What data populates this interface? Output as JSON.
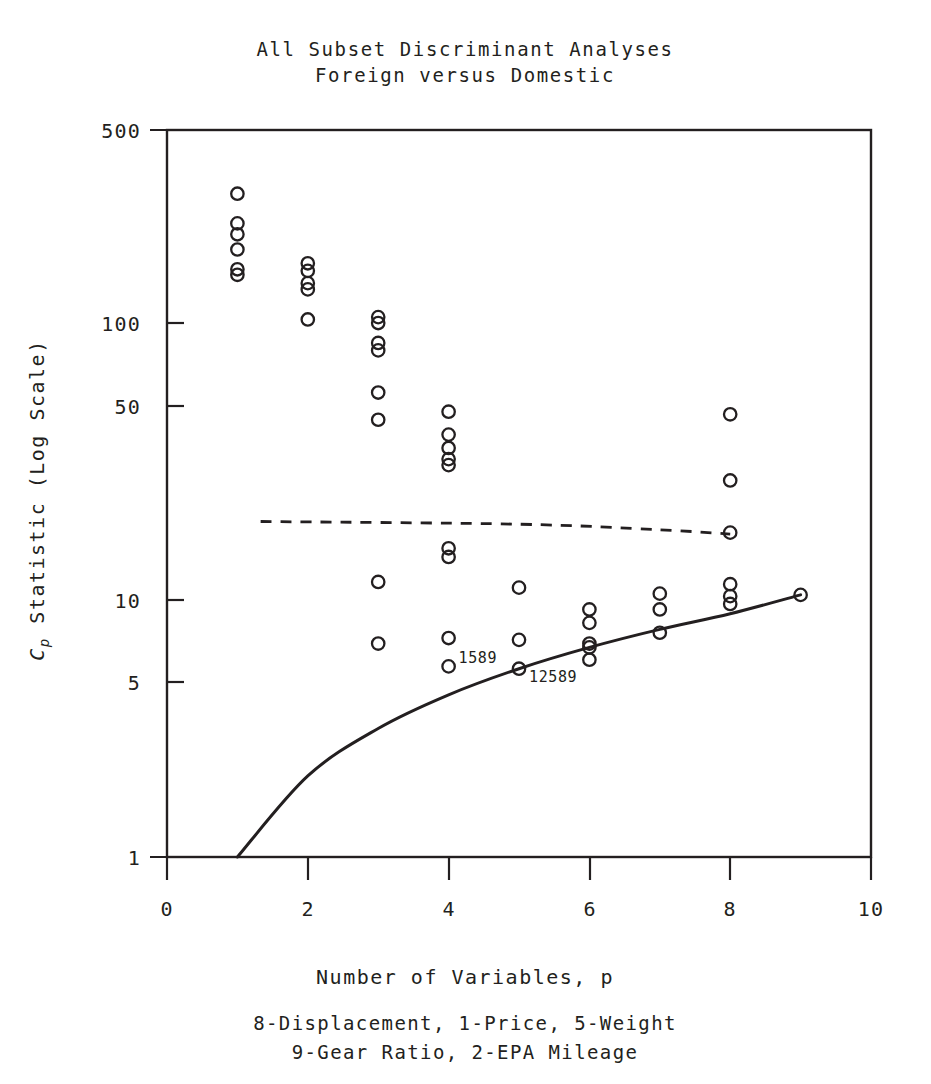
{
  "figure": {
    "title_line1": "All Subset Discriminant Analyses",
    "title_line2": "Foreign versus Domestic",
    "xlabel": "Number of Variables, p",
    "ylabel_prefix": "C",
    "ylabel_sub": "p",
    "ylabel_rest": " Statistic (Log Scale)",
    "caption_line1": "8-Displacement, 1-Price, 5-Weight",
    "caption_line2": "9-Gear Ratio, 2-EPA Mileage",
    "ink_color": "#231f20",
    "background_color": "#ffffff"
  },
  "chart_data": {
    "type": "scatter",
    "xlabel": "Number of Variables, p",
    "ylabel": "Cp Statistic (Log Scale)",
    "xlim": [
      0,
      10
    ],
    "ylim": [
      1,
      500
    ],
    "yscale": "log",
    "xscale": "linear",
    "grid": false,
    "legend": "none",
    "xticks": [
      0,
      2,
      4,
      6,
      8,
      10
    ],
    "xticklabels": [
      "0",
      "2",
      "4",
      "6",
      "8",
      "10"
    ],
    "yticks": [
      1,
      5,
      10,
      50,
      100,
      500
    ],
    "yticklabels": [
      "1",
      "5",
      "10",
      "50",
      "100",
      "500"
    ],
    "marker": "open-circle",
    "points": [
      {
        "x": 1,
        "y": 290
      },
      {
        "x": 1,
        "y": 225
      },
      {
        "x": 1,
        "y": 205
      },
      {
        "x": 1,
        "y": 180
      },
      {
        "x": 1,
        "y": 152
      },
      {
        "x": 1,
        "y": 145
      },
      {
        "x": 2,
        "y": 160
      },
      {
        "x": 2,
        "y": 150
      },
      {
        "x": 2,
        "y": 135
      },
      {
        "x": 2,
        "y": 128
      },
      {
        "x": 2,
        "y": 99
      },
      {
        "x": 3,
        "y": 101
      },
      {
        "x": 3,
        "y": 96
      },
      {
        "x": 3,
        "y": 81
      },
      {
        "x": 3,
        "y": 76
      },
      {
        "x": 3,
        "y": 53
      },
      {
        "x": 3,
        "y": 42
      },
      {
        "x": 3,
        "y": 10.5
      },
      {
        "x": 3,
        "y": 6.2
      },
      {
        "x": 4,
        "y": 45
      },
      {
        "x": 4,
        "y": 37
      },
      {
        "x": 4,
        "y": 33
      },
      {
        "x": 4,
        "y": 30
      },
      {
        "x": 4,
        "y": 28.5
      },
      {
        "x": 4,
        "y": 14
      },
      {
        "x": 4,
        "y": 13
      },
      {
        "x": 4,
        "y": 6.5
      },
      {
        "x": 4,
        "y": 5.1
      },
      {
        "x": 5,
        "y": 10
      },
      {
        "x": 5,
        "y": 6.4
      },
      {
        "x": 5,
        "y": 5.0
      },
      {
        "x": 6,
        "y": 8.3
      },
      {
        "x": 6,
        "y": 7.4
      },
      {
        "x": 6,
        "y": 6.2
      },
      {
        "x": 6,
        "y": 6.0
      },
      {
        "x": 6,
        "y": 5.4
      },
      {
        "x": 7,
        "y": 9.5
      },
      {
        "x": 7,
        "y": 8.3
      },
      {
        "x": 7,
        "y": 6.8
      },
      {
        "x": 8,
        "y": 44
      },
      {
        "x": 8,
        "y": 25
      },
      {
        "x": 8,
        "y": 16
      },
      {
        "x": 8,
        "y": 10.3
      },
      {
        "x": 8,
        "y": 9.3
      },
      {
        "x": 8,
        "y": 8.7
      },
      {
        "x": 9,
        "y": 9.4
      }
    ],
    "annotations": [
      {
        "text": "1589",
        "x": 4,
        "y": 5.1,
        "position": "right"
      },
      {
        "text": "12589",
        "x": 5,
        "y": 5.0,
        "position": "below-right"
      }
    ],
    "reference_lines": [
      {
        "name": "cp-equals-p",
        "style": "solid",
        "description": "Cp = p reference curve",
        "points": [
          [
            1,
            1
          ],
          [
            2,
            2
          ],
          [
            3,
            3
          ],
          [
            4,
            4
          ],
          [
            5,
            5
          ],
          [
            6,
            6
          ],
          [
            7,
            7
          ],
          [
            8,
            8
          ],
          [
            9,
            9.4
          ]
        ]
      },
      {
        "name": "upper-threshold",
        "style": "dashed",
        "description": "near-horizontal dashed threshold",
        "points": [
          [
            1.33,
            17.6
          ],
          [
            5.0,
            17.2
          ],
          [
            7.0,
            16.4
          ],
          [
            8.0,
            15.8
          ]
        ]
      }
    ]
  }
}
